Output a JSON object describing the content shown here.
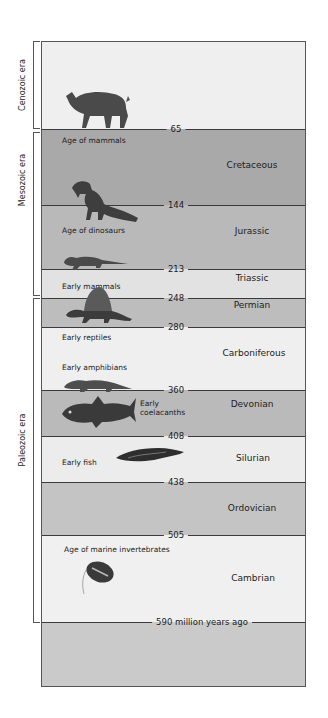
{
  "eras": [
    {
      "name": "Cenozoic era",
      "top": 41,
      "bottom": 128,
      "label_y": 85
    },
    {
      "name": "Mesozoic era",
      "top": 132,
      "bottom": 294,
      "label_y": 180
    },
    {
      "name": "Paleozoic era",
      "top": 298,
      "bottom": 621,
      "label_y": 440
    }
  ],
  "boundaries": [
    {
      "label": "65",
      "y": 87,
      "bg_after": "#a9a9a9"
    },
    {
      "label": "144",
      "y": 163,
      "bg_after": "#b9b9b9"
    },
    {
      "label": "213",
      "y": 227,
      "bg_after": "#e2e2e2"
    },
    {
      "label": "248",
      "y": 256,
      "bg_after": "#bdbdbd"
    },
    {
      "label": "280",
      "y": 285,
      "bg_after": "#efefef"
    },
    {
      "label": "360",
      "y": 348,
      "bg_after": "#bababa"
    },
    {
      "label": "408",
      "y": 394,
      "bg_after": "#ececec"
    },
    {
      "label": "438",
      "y": 440,
      "bg_after": "#c4c4c4"
    },
    {
      "label": "505",
      "y": 493,
      "bg_after": "#f0f0f0"
    },
    {
      "label": "590 million years ago",
      "y": 580,
      "bg_after": "#cacaca"
    }
  ],
  "top_band_color": "#efefef",
  "periods": [
    {
      "name": "Cretaceous",
      "x": 210,
      "y": 123
    },
    {
      "name": "Jurassic",
      "x": 210,
      "y": 189
    },
    {
      "name": "Triassic",
      "x": 210,
      "y": 236
    },
    {
      "name": "Permian",
      "x": 210,
      "y": 263
    },
    {
      "name": "Carboniferous",
      "x": 212,
      "y": 311
    },
    {
      "name": "Devonian",
      "x": 210,
      "y": 362
    },
    {
      "name": "Silurian",
      "x": 211,
      "y": 416
    },
    {
      "name": "Ordovician",
      "x": 210,
      "y": 466
    },
    {
      "name": "Cambrian",
      "x": 211,
      "y": 536
    }
  ],
  "captions": [
    {
      "text": "Age of mammals",
      "x": 20,
      "y": 94
    },
    {
      "text": "Age of dinosaurs",
      "x": 20,
      "y": 184
    },
    {
      "text": "Early mammals",
      "x": 20,
      "y": 240
    },
    {
      "text": "Early reptiles",
      "x": 20,
      "y": 291
    },
    {
      "text": "Early amphibians",
      "x": 20,
      "y": 321
    },
    {
      "text": "Early",
      "x": 98,
      "y": 357
    },
    {
      "text": "coelacanths",
      "x": 98,
      "y": 366
    },
    {
      "text": "Early fish",
      "x": 20,
      "y": 416
    },
    {
      "text": "Age of marine invertebrates",
      "x": 22,
      "y": 503
    }
  ],
  "creatures": [
    {
      "name": "mammal-rhino-icon"
    },
    {
      "name": "dinosaur-icon"
    },
    {
      "name": "early-mammal-icon"
    },
    {
      "name": "dimetrodon-reptile-icon"
    },
    {
      "name": "amphibian-icon"
    },
    {
      "name": "coelacanth-fish-icon"
    },
    {
      "name": "early-fish-icon"
    },
    {
      "name": "trilobite-icon"
    }
  ]
}
